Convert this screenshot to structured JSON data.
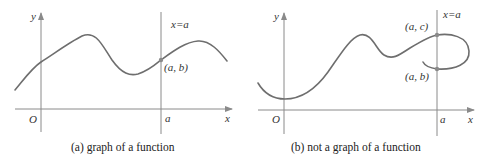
{
  "panel_a": {
    "caption": "(a) graph of a function",
    "y_label": "y",
    "x_label": "x",
    "origin_label": "O",
    "a_label": "a",
    "line_label": "x=a",
    "point_label": "(a,  b)"
  },
  "panel_b": {
    "caption": "(b) not a graph of a function",
    "y_label": "y",
    "x_label": "x",
    "origin_label": "O",
    "a_label": "a",
    "line_label": "x=a",
    "point_c_label": "(a,  c)",
    "point_b_label": "(a,  b)"
  },
  "colors": {
    "axis": "#8a8a8a",
    "curve": "#6e6e6e",
    "text": "#333333"
  }
}
